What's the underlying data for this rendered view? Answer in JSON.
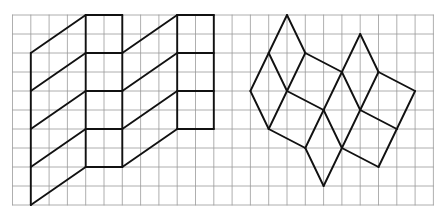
{
  "grid": {
    "origin_x": 12.5,
    "origin_y": 15,
    "cell_w": 18.3,
    "cell_h": 19,
    "cols": 23,
    "rows": 10,
    "line_color": "#9a9a9a",
    "line_width": 0.8
  },
  "figure_style": {
    "stroke": "#111111",
    "stroke_width": 1.9
  },
  "figures": [
    {
      "name": "left-zigzag-prism-figure",
      "segments": [
        [
          [
            1,
            2
          ],
          [
            1,
            10
          ]
        ],
        [
          [
            1,
            2
          ],
          [
            4,
            0
          ]
        ],
        [
          [
            1,
            4
          ],
          [
            4,
            2
          ]
        ],
        [
          [
            1,
            6
          ],
          [
            4,
            4
          ]
        ],
        [
          [
            1,
            8
          ],
          [
            4,
            6
          ]
        ],
        [
          [
            1,
            10
          ],
          [
            4,
            8
          ]
        ],
        [
          [
            4,
            0
          ],
          [
            4,
            8
          ]
        ],
        [
          [
            6,
            0
          ],
          [
            6,
            8
          ]
        ],
        [
          [
            4,
            0
          ],
          [
            6,
            0
          ]
        ],
        [
          [
            4,
            2
          ],
          [
            6,
            2
          ]
        ],
        [
          [
            4,
            4
          ],
          [
            6,
            4
          ]
        ],
        [
          [
            4,
            6
          ],
          [
            6,
            6
          ]
        ],
        [
          [
            4,
            8
          ],
          [
            6,
            8
          ]
        ],
        [
          [
            6,
            2
          ],
          [
            9,
            0
          ]
        ],
        [
          [
            6,
            4
          ],
          [
            9,
            2
          ]
        ],
        [
          [
            6,
            6
          ],
          [
            9,
            4
          ]
        ],
        [
          [
            6,
            8
          ],
          [
            9,
            6
          ]
        ],
        [
          [
            9,
            0
          ],
          [
            9,
            6
          ]
        ],
        [
          [
            11,
            0
          ],
          [
            11,
            6
          ]
        ],
        [
          [
            9,
            0
          ],
          [
            11,
            0
          ]
        ],
        [
          [
            9,
            2
          ],
          [
            11,
            2
          ]
        ],
        [
          [
            9,
            4
          ],
          [
            11,
            4
          ]
        ],
        [
          [
            9,
            6
          ],
          [
            11,
            6
          ]
        ]
      ]
    },
    {
      "name": "right-rhombus-tiling-figure",
      "segments": [
        [
          [
            15,
            0
          ],
          [
            14,
            2
          ]
        ],
        [
          [
            15,
            0
          ],
          [
            16,
            2
          ]
        ],
        [
          [
            14,
            2
          ],
          [
            13,
            4
          ]
        ],
        [
          [
            14,
            2
          ],
          [
            15,
            4
          ]
        ],
        [
          [
            16,
            2
          ],
          [
            15,
            4
          ]
        ],
        [
          [
            13,
            4
          ],
          [
            14,
            6
          ]
        ],
        [
          [
            15,
            4
          ],
          [
            14,
            6
          ]
        ],
        [
          [
            16,
            2
          ],
          [
            18,
            3
          ]
        ],
        [
          [
            15,
            4
          ],
          [
            17,
            5
          ]
        ],
        [
          [
            14,
            6
          ],
          [
            16,
            7
          ]
        ],
        [
          [
            18,
            3
          ],
          [
            17,
            5
          ]
        ],
        [
          [
            17,
            5
          ],
          [
            16,
            7
          ]
        ],
        [
          [
            18,
            3
          ],
          [
            19,
            1
          ]
        ],
        [
          [
            19,
            1
          ],
          [
            20,
            3
          ]
        ],
        [
          [
            18,
            3
          ],
          [
            19,
            5
          ]
        ],
        [
          [
            20,
            3
          ],
          [
            19,
            5
          ]
        ],
        [
          [
            20,
            3
          ],
          [
            22,
            4
          ]
        ],
        [
          [
            22,
            4
          ],
          [
            21,
            6
          ]
        ],
        [
          [
            19,
            5
          ],
          [
            21,
            6
          ]
        ],
        [
          [
            17,
            5
          ],
          [
            18,
            7
          ]
        ],
        [
          [
            19,
            5
          ],
          [
            18,
            7
          ]
        ],
        [
          [
            16,
            7
          ],
          [
            17,
            9
          ]
        ],
        [
          [
            18,
            7
          ],
          [
            17,
            9
          ]
        ],
        [
          [
            18,
            7
          ],
          [
            20,
            8
          ]
        ],
        [
          [
            21,
            6
          ],
          [
            20,
            8
          ]
        ]
      ]
    }
  ]
}
